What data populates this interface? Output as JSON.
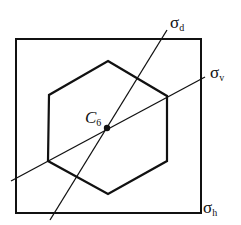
{
  "diagram": {
    "square": {
      "x": 16,
      "y": 39,
      "w": 185,
      "h": 174
    },
    "hexagon": {
      "points": "108,61 167,96 167,161 108,194 48,161 49,95"
    },
    "center": {
      "x": 107,
      "y": 128
    },
    "lines": {
      "sigma_d": {
        "x1": 50,
        "y1": 220,
        "x2": 167,
        "y2": 30
      },
      "sigma_v": {
        "x1": 11,
        "y1": 181,
        "x2": 205,
        "y2": 77
      }
    },
    "labels": {
      "sigma_d": {
        "symbol": "σ",
        "sub": "d"
      },
      "sigma_v": {
        "symbol": "σ",
        "sub": "v"
      },
      "sigma_h": {
        "symbol": "σ",
        "sub": "h"
      },
      "c6": {
        "symbol": "C",
        "sub": "6"
      }
    },
    "colors": {
      "stroke": "#111111",
      "background": "#ffffff"
    }
  }
}
